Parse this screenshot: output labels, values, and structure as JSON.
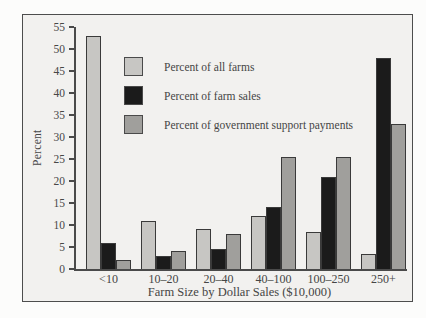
{
  "chart_data": {
    "type": "bar",
    "title": "",
    "xlabel": "Farm Size by Dollar Sales ($10,000)",
    "ylabel": "Percent",
    "categories": [
      "<10",
      "10–20",
      "20–40",
      "40–100",
      "100–250",
      "250+"
    ],
    "series": [
      {
        "name": "Percent of all farms",
        "color": "#c7c6c3",
        "values": [
          53,
          11,
          9,
          12,
          8.5,
          3.5
        ]
      },
      {
        "name": "Percent of farm sales",
        "color": "#1b1b1b",
        "values": [
          6,
          3,
          4.5,
          14,
          21,
          48
        ]
      },
      {
        "name": "Percent of government support payments",
        "color": "#a09f9c",
        "values": [
          2,
          4,
          8,
          25.5,
          25.5,
          33
        ]
      }
    ],
    "ylim": [
      0,
      55
    ],
    "ytick_step": 5,
    "grid": false,
    "legend_position": "upper-left-inside"
  },
  "colors": {
    "page_bg": "#fcfcfb",
    "panel_bg": "#f2f1ef",
    "frame_border": "#4d4d4d",
    "axis": "#4a4a4a",
    "text": "#454545",
    "bar_outline": "#3a3a3a"
  }
}
